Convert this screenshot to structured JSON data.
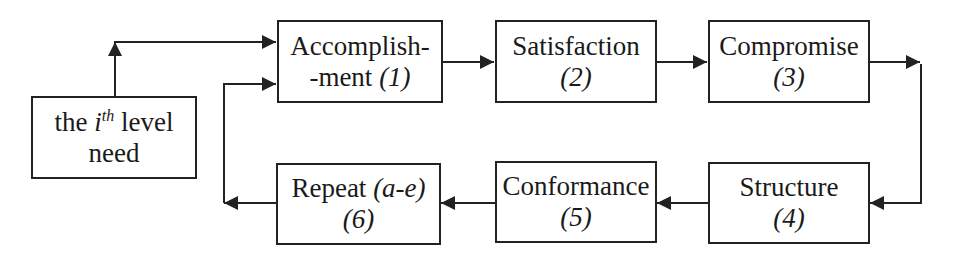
{
  "diagram": {
    "type": "flowchart",
    "start_node": {
      "line1_prefix": "the ",
      "line1_var": "i",
      "line1_sup": "th",
      "line1_suffix": " level",
      "line2": "need"
    },
    "nodes": [
      {
        "id": "accomplishment",
        "line1": "Accomplish-",
        "line2_text": "-ment ",
        "num": "(1)"
      },
      {
        "id": "satisfaction",
        "line1": "Satisfaction",
        "line2_text": "",
        "num": "(2)"
      },
      {
        "id": "compromise",
        "line1": "Compromise",
        "line2_text": "",
        "num": "(3)"
      },
      {
        "id": "structure",
        "line1": "Structure",
        "line2_text": "",
        "num": "(4)"
      },
      {
        "id": "conformance",
        "line1": "Conformance",
        "line2_text": "",
        "num": "(5)"
      },
      {
        "id": "repeat",
        "line1_text": "Repeat ",
        "line1_italic": "(a-e)",
        "num": "(6)"
      }
    ],
    "edges": [
      {
        "from": "need",
        "to": "accomplishment"
      },
      {
        "from": "accomplishment",
        "to": "satisfaction"
      },
      {
        "from": "satisfaction",
        "to": "compromise"
      },
      {
        "from": "compromise",
        "to": "structure"
      },
      {
        "from": "structure",
        "to": "conformance"
      },
      {
        "from": "conformance",
        "to": "repeat"
      },
      {
        "from": "repeat",
        "to": "accomplishment"
      }
    ]
  }
}
